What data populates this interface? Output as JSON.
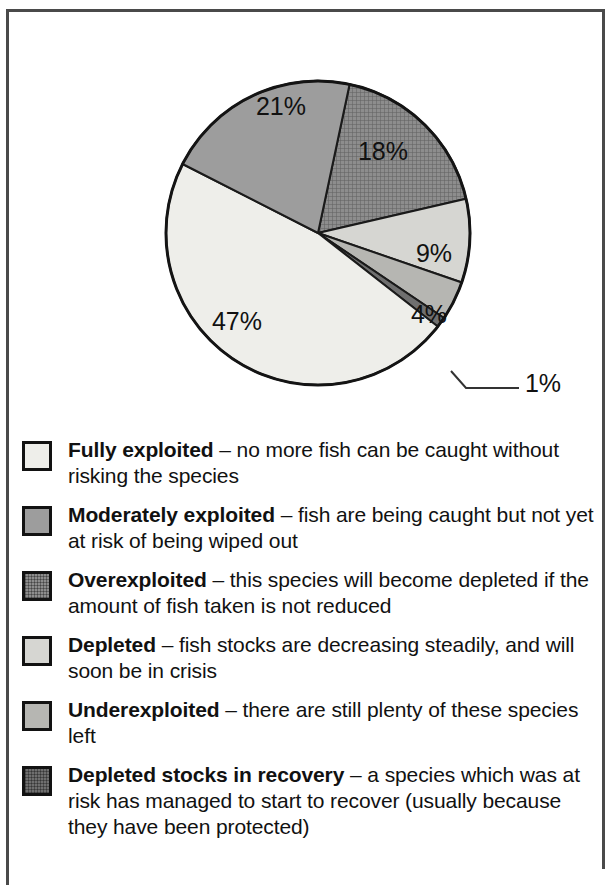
{
  "chart_data": {
    "type": "pie",
    "title": "",
    "subtitle": "",
    "xlabel": "",
    "ylabel": "",
    "legend_position": "below",
    "grid": false,
    "unit": "%",
    "categories": [
      "Fully exploited",
      "Moderately exploited",
      "Overexploited",
      "Depleted",
      "Underexploited",
      "Depleted stocks in recovery"
    ],
    "values": [
      47,
      21,
      18,
      9,
      4,
      1
    ],
    "labels": [
      "47%",
      "21%",
      "18%",
      "9%",
      "4%",
      "1%"
    ],
    "colors": [
      "#eeeeea",
      "#9d9d9d",
      "#8d8d8d",
      "#d6d6d2",
      "#b6b6b2",
      "#6f6f6f"
    ],
    "annotations": [
      {
        "text": "1%",
        "note": "leader line from the 1% slice to the label at right"
      }
    ],
    "slices": [
      {
        "name": "Overexploited",
        "value": 18,
        "label": "18%",
        "start_deg": 12,
        "end_deg": 77,
        "color": "#8d8d8d",
        "pattern": "crosshatch",
        "label_x": 383,
        "label_y": 160
      },
      {
        "name": "Depleted",
        "value": 9,
        "label": "9%",
        "start_deg": 77,
        "end_deg": 109,
        "color": "#d6d6d2",
        "pattern": "solid",
        "label_x": 434,
        "label_y": 262
      },
      {
        "name": "Underexploited",
        "value": 4,
        "label": "4%",
        "start_deg": 109,
        "end_deg": 124,
        "color": "#b6b6b2",
        "pattern": "solid",
        "label_x": 429,
        "label_y": 323
      },
      {
        "name": "Depleted stocks in recovery",
        "value": 1,
        "label": "1%",
        "start_deg": 124,
        "end_deg": 128,
        "color": "#6f6f6f",
        "pattern": "solid",
        "label_x": 543,
        "label_y": 392
      },
      {
        "name": "Fully exploited",
        "value": 47,
        "label": "47%",
        "start_deg": 128,
        "end_deg": 297,
        "color": "#eeeeea",
        "pattern": "solid",
        "label_x": 237,
        "label_y": 330
      },
      {
        "name": "Moderately exploited",
        "value": 21,
        "label": "21%",
        "start_deg": 297,
        "end_deg": 372,
        "color": "#9d9d9d",
        "pattern": "solid",
        "label_x": 281,
        "label_y": 115
      }
    ]
  },
  "legend": {
    "items": [
      {
        "term": "Fully exploited",
        "dash": " – ",
        "description": "no more fish can be caught without risking the species",
        "color": "#eeeeea",
        "pattern": "solid"
      },
      {
        "term": "Moderately exploited",
        "dash": " – ",
        "description": "fish are being caught but not yet at risk of being wiped out",
        "color": "#9d9d9d",
        "pattern": "solid"
      },
      {
        "term": "Overexploited",
        "dash": " – ",
        "description": "this species will become depleted if the amount of fish taken is not reduced",
        "color": "#8d8d8d",
        "pattern": "crosshatch"
      },
      {
        "term": "Depleted",
        "dash": " – ",
        "description": "fish stocks are decreasing steadily, and will soon be in crisis",
        "color": "#d6d6d2",
        "pattern": "solid"
      },
      {
        "term": "Underexploited",
        "dash": " – ",
        "description": "there are still plenty of these species left",
        "color": "#b6b6b2",
        "pattern": "solid"
      },
      {
        "term": "Depleted stocks in recovery",
        "dash": " – ",
        "description": "a species which was at risk has managed to start to recover (usually because they have been protected)",
        "color": "#6f6f6f",
        "pattern": "crosshatch"
      }
    ]
  },
  "frame": {
    "border_color": "#4a4a4a"
  }
}
